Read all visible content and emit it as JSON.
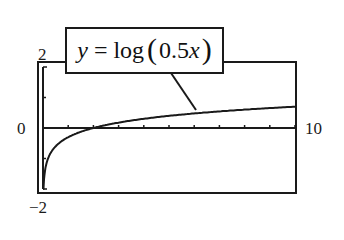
{
  "chart_data": {
    "type": "line",
    "title": "",
    "function": "y = log(0.5x)",
    "annotation": {
      "prefix": "y",
      "equals": " = log",
      "paren_open": "(",
      "arg": "0.5",
      "var": "x",
      "paren_close": ")"
    },
    "xlabel": "",
    "ylabel": "",
    "xlim": [
      0,
      10
    ],
    "ylim": [
      -2,
      2
    ],
    "x_tick_step": 1,
    "y_tick_step": 1,
    "grid": false,
    "legend": "none",
    "tick_labels": {
      "y_max": "2",
      "y_min": "−2",
      "x_min": "0",
      "x_max": "10"
    },
    "series": [
      {
        "name": "y = log(0.5x)",
        "x": [
          0.1,
          0.2,
          0.3,
          0.5,
          0.75,
          1,
          1.5,
          2,
          3,
          4,
          5,
          6,
          7,
          8,
          9,
          10
        ],
        "y": [
          -1.301,
          -1.0,
          -0.824,
          -0.602,
          -0.426,
          -0.301,
          -0.125,
          0.0,
          0.176,
          0.301,
          0.398,
          0.477,
          0.544,
          0.602,
          0.653,
          0.699
        ]
      }
    ]
  }
}
